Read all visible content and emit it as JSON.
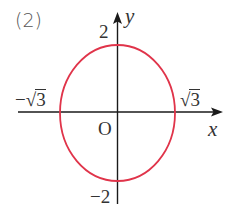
{
  "figure": {
    "part_label": "(2)",
    "axes": {
      "x_label": "x",
      "y_label": "y",
      "origin_label": "O"
    },
    "ticks": {
      "y_top": "2",
      "y_bottom": "−2",
      "x_left_sign": "−",
      "x_left_radical": "√",
      "x_left_radicand": "3",
      "x_right_radical": "√",
      "x_right_radicand": "3"
    },
    "curve": {
      "type": "ellipse",
      "equation_semi_axes": {
        "a_x": "√3",
        "b_y": "2"
      },
      "color": "#e0344a"
    },
    "colors": {
      "axis": "#1a1a1a",
      "text": "#333333",
      "curve": "#e0344a",
      "background": "#ffffff"
    }
  }
}
